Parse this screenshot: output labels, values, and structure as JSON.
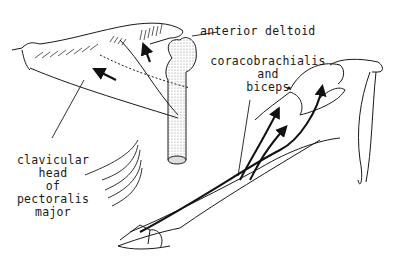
{
  "figure": {
    "type": "anatomical-line-drawing",
    "labels": {
      "anterior_deltoid": "anterior deltoid",
      "coracobrachialis_line1": "coracobrachialis",
      "coracobrachialis_line2": "and",
      "coracobrachialis_line3": "biceps",
      "pectoralis_line1": "clavicular",
      "pectoralis_line2": "head",
      "pectoralis_line3": "of",
      "pectoralis_line4": "pectoralis",
      "pectoralis_line5": "major"
    },
    "colors": {
      "ink": "#1a1a1a",
      "stipple": "#9a9a9a",
      "background": "#ffffff"
    }
  }
}
